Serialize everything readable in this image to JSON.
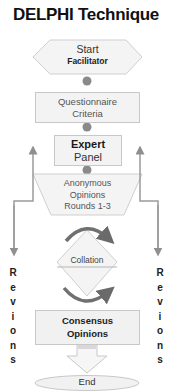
{
  "title": "DELPHI Technique",
  "nodes": {
    "start": {
      "shape": "hexagon",
      "line1": "Start",
      "line2": "Facilitator"
    },
    "questionnaire": {
      "shape": "rectangle",
      "line1": "Questionnaire",
      "line2": "Criteria"
    },
    "expert_panel": {
      "shape": "rectangle",
      "line1": "Expert",
      "line2": "Panel"
    },
    "anonymous_opinions": {
      "shape": "trapezoid",
      "line1": "Anonymous",
      "line2": "Opinions",
      "line3": "Rounds 1-3"
    },
    "collation": {
      "shape": "diamond",
      "line1": "Collation"
    },
    "consensus": {
      "shape": "rectangle",
      "line1": "Consensus",
      "line2": "Opinions"
    },
    "end": {
      "shape": "ellipse",
      "line1": "End"
    }
  },
  "side_labels": {
    "left": [
      "R",
      "e",
      "v",
      "i",
      "o",
      "n",
      "s"
    ],
    "right": [
      "R",
      "e",
      "v",
      "i",
      "o",
      "n",
      "s"
    ]
  },
  "colors": {
    "shape_fill": "#f3f3f3",
    "shape_border": "#c8c8c8",
    "connector_dot": "#8a8a8a",
    "arrow_line": "#9a9a9a",
    "curved_arrow": "#707070"
  }
}
